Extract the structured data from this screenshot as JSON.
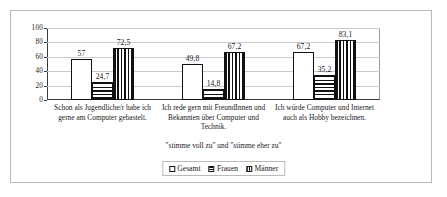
{
  "chart_data": {
    "type": "bar",
    "title": "",
    "subtitle": "",
    "xlabel": "\"stimme voll zu\" und \"stimme eher zu\"",
    "ylabel": "",
    "ylim": [
      0,
      100
    ],
    "yticks": [
      0,
      20,
      40,
      60,
      80,
      100
    ],
    "ytick_labels": [
      "0",
      "20",
      "40",
      "60",
      "80",
      "100"
    ],
    "grid": true,
    "legend_position": "bottom",
    "categories": [
      "Schon als Jugendliche/r habe ich gerne am Computer gebastelt.",
      "Ich rede gern mit FreundInnen und Bekannten über Computer und Technik.",
      "Ich würde Computer und Internet auch als Hobby bezeichnen."
    ],
    "series": [
      {
        "name": "Gesamt",
        "pattern": "solid",
        "values": [
          57,
          49.8,
          67.2
        ],
        "labels": [
          "57",
          "49,8",
          "67,2"
        ]
      },
      {
        "name": "Frauen",
        "pattern": "horizontal-stripes",
        "values": [
          24.7,
          14.8,
          35.2
        ],
        "labels": [
          "24,7",
          "14,8",
          "35,2"
        ]
      },
      {
        "name": "Männer",
        "pattern": "vertical-stripes",
        "values": [
          72.5,
          67.2,
          83.1
        ],
        "labels": [
          "72,5",
          "67,2",
          "83,1"
        ]
      }
    ]
  },
  "colors": {
    "bar_outline": "#111111",
    "bar_fill": "#ffffff",
    "gridline": "#c9c9c9",
    "axis": "#3a3a3a",
    "frame": "#b9b9b9",
    "text": "#1a1a1a"
  }
}
